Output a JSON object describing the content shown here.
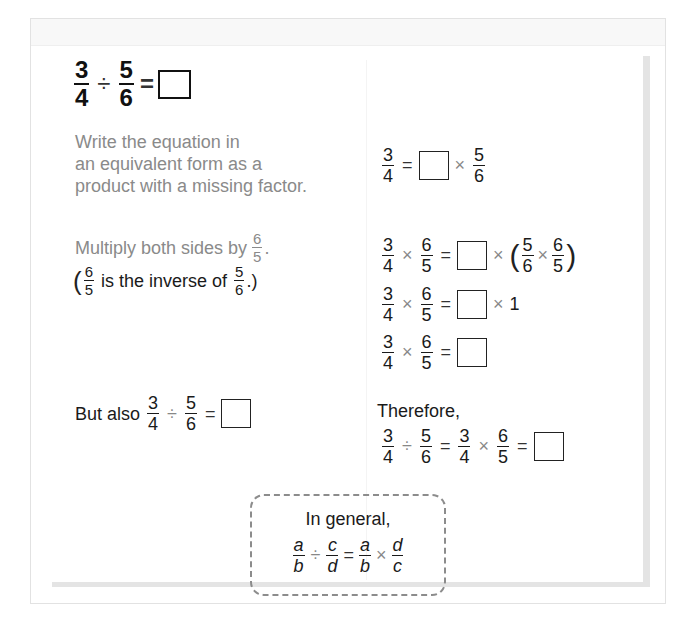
{
  "title_equation": {
    "a_num": "3",
    "a_den": "4",
    "op": "÷",
    "b_num": "5",
    "b_den": "6",
    "eq": "="
  },
  "steps": {
    "step1": {
      "left_lines": [
        "Write the equation in",
        "an equivalent form as a",
        "product with a missing factor."
      ],
      "right": {
        "a_num": "3",
        "a_den": "4",
        "eq": "=",
        "times": "×",
        "b_num": "5",
        "b_den": "6"
      }
    },
    "step2": {
      "left_line1_text": "Multiply both sides by",
      "left_line1_frac": {
        "num": "6",
        "den": "5"
      },
      "left_line1_end": ".",
      "left_line2_open": "(",
      "left_line2_frac1": {
        "num": "6",
        "den": "5"
      },
      "left_line2_text": "is the inverse of",
      "left_line2_frac2": {
        "num": "5",
        "den": "6"
      },
      "left_line2_close": ".)",
      "right_lines": [
        {
          "a_num": "3",
          "a_den": "4",
          "times": "×",
          "b_num": "6",
          "b_den": "5",
          "eq": "=",
          "times2": "×",
          "open": "(",
          "c_num": "5",
          "c_den": "6",
          "times3": "×",
          "d_num": "6",
          "d_den": "5",
          "close": ")"
        },
        {
          "a_num": "3",
          "a_den": "4",
          "times": "×",
          "b_num": "6",
          "b_den": "5",
          "eq": "=",
          "times2": "×",
          "one": "1"
        },
        {
          "a_num": "3",
          "a_den": "4",
          "times": "×",
          "b_num": "6",
          "b_den": "5",
          "eq": "="
        }
      ]
    },
    "step3": {
      "left_text": "But also",
      "left_eq": {
        "a_num": "3",
        "a_den": "4",
        "op": "÷",
        "b_num": "5",
        "b_den": "6",
        "eq": "="
      },
      "right_label": "Therefore,",
      "right_eq": {
        "a_num": "3",
        "a_den": "4",
        "op": "÷",
        "b_num": "5",
        "b_den": "6",
        "eq": "=",
        "c_num": "3",
        "c_den": "4",
        "times": "×",
        "d_num": "6",
        "d_den": "5",
        "eq2": "="
      }
    }
  },
  "general": {
    "label": "In general,",
    "a": "a",
    "b": "b",
    "op": "÷",
    "c": "c",
    "d": "d",
    "eq": "=",
    "times": "×"
  }
}
